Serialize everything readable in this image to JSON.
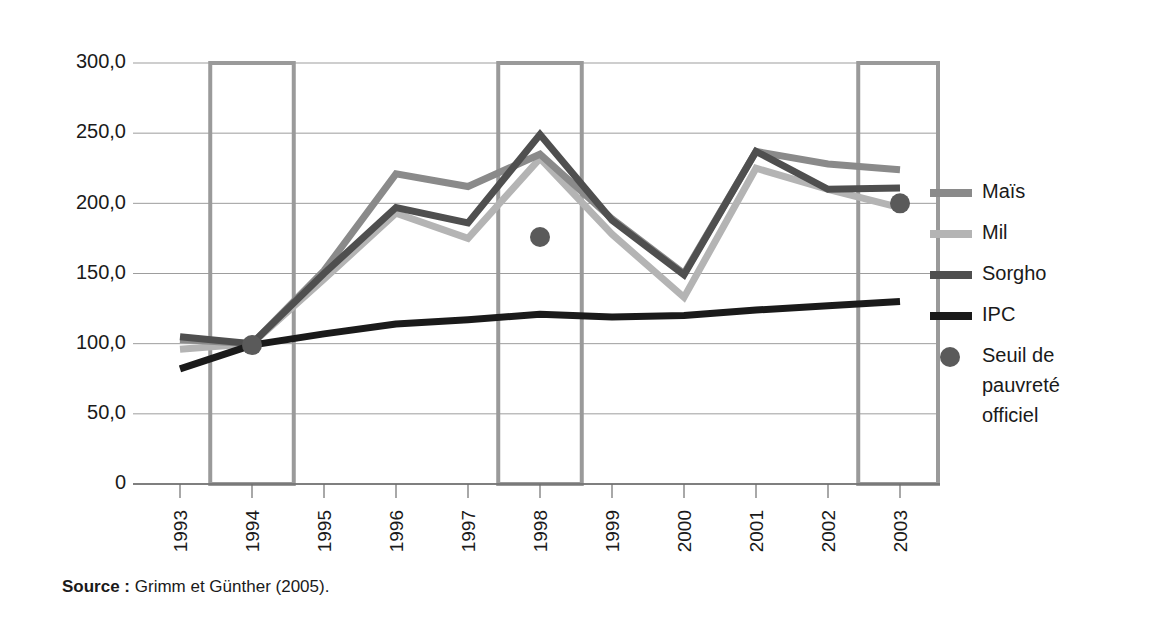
{
  "source_note": {
    "label": "Source :",
    "text": " Grimm et Günther (2005)."
  },
  "legend": {
    "items": [
      {
        "name": "Maïs",
        "color": "#8a8a8a",
        "marker": "line"
      },
      {
        "name": "Mil",
        "color": "#b4b4b4",
        "marker": "line"
      },
      {
        "name": "Sorgho",
        "color": "#4f4f4f",
        "marker": "line"
      },
      {
        "name": "IPC",
        "color": "#1a1a1a",
        "marker": "line"
      },
      {
        "name": "Seuil de pauvreté officiel",
        "color": "#5a5a5a",
        "marker": "dot",
        "lines": [
          "Seuil de",
          "pauvreté",
          "officiel"
        ]
      }
    ]
  },
  "chart_data": {
    "type": "line",
    "title": "",
    "xlabel": "",
    "ylabel": "",
    "x": [
      "1993",
      "1994",
      "1995",
      "1996",
      "1997",
      "1998",
      "1999",
      "2000",
      "2001",
      "2002",
      "2003"
    ],
    "ytick_labels": [
      "300,0",
      "250,0",
      "200,0",
      "150,0",
      "100,0",
      "50,0",
      "0"
    ],
    "ytick_values": [
      300,
      250,
      200,
      150,
      100,
      50,
      0
    ],
    "ylim": [
      0,
      300
    ],
    "grid": "horizontal",
    "legend_position": "right",
    "series": [
      {
        "name": "Maïs",
        "color": "#8a8a8a",
        "values": [
          103,
          100,
          152,
          221,
          212,
          235,
          189,
          150,
          237,
          228,
          224
        ]
      },
      {
        "name": "Mil",
        "color": "#b4b4b4",
        "values": [
          96,
          100,
          146,
          193,
          175,
          232,
          178,
          133,
          225,
          210,
          197
        ]
      },
      {
        "name": "Sorgho",
        "color": "#4f4f4f",
        "values": [
          105,
          100,
          150,
          197,
          186,
          249,
          188,
          149,
          237,
          210,
          211
        ]
      },
      {
        "name": "IPC",
        "color": "#1a1a1a",
        "values": [
          82,
          99,
          107,
          114,
          117,
          121,
          119,
          120,
          124,
          127,
          130
        ]
      }
    ],
    "points": [
      {
        "name": "Seuil de pauvreté officiel",
        "x": "1994",
        "y": 99,
        "color": "#5a5a5a"
      },
      {
        "name": "Seuil de pauvreté officiel",
        "x": "1998",
        "y": 176,
        "color": "#5a5a5a"
      },
      {
        "name": "Seuil de pauvreté officiel",
        "x": "2003",
        "y": 200,
        "color": "#5a5a5a"
      }
    ],
    "highlight_bands": [
      {
        "center": "1994",
        "from": 0,
        "to": 300
      },
      {
        "center": "1998",
        "from": 0,
        "to": 300
      },
      {
        "center": "2003",
        "from": 0,
        "to": 300
      }
    ],
    "band_color": "#9a9a9a"
  }
}
